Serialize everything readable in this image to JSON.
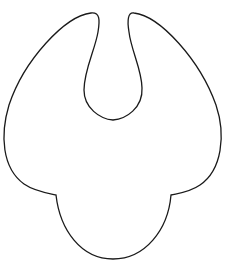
{
  "figure": {
    "stroke_color": "#1a1a1a",
    "fill_color": "#ffffff",
    "background": "#ffffff"
  }
}
